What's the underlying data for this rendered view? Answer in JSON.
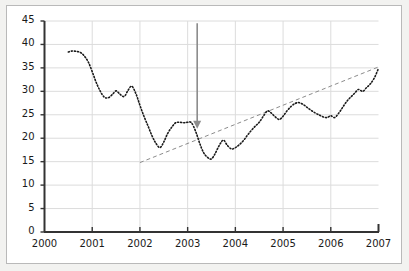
{
  "chart_data": {
    "type": "line",
    "title": "",
    "subtitle": "",
    "xlabel": "",
    "ylabel": "",
    "xlim": [
      2000,
      2007
    ],
    "ylim": [
      0,
      45
    ],
    "grid": true,
    "legend": "none",
    "x_ticks": [
      "2000",
      "2001",
      "2002",
      "2003",
      "2004",
      "2005",
      "2006",
      "2007"
    ],
    "y_ticks": [
      "0",
      "5",
      "10",
      "15",
      "20",
      "25",
      "30",
      "35",
      "40",
      "45"
    ],
    "series": [
      {
        "name": "observed",
        "style": "dotted",
        "color": "#1a1a1a",
        "x": [
          2000.5,
          2000.58,
          2000.67,
          2000.75,
          2000.83,
          2000.92,
          2001.0,
          2001.08,
          2001.17,
          2001.25,
          2001.33,
          2001.42,
          2001.5,
          2001.58,
          2001.67,
          2001.75,
          2001.83,
          2001.92,
          2002.0,
          2002.08,
          2002.17,
          2002.25,
          2002.33,
          2002.42,
          2002.5,
          2002.58,
          2002.67,
          2002.75,
          2002.83,
          2002.92,
          2003.0,
          2003.08,
          2003.17,
          2003.25,
          2003.33,
          2003.42,
          2003.5,
          2003.58,
          2003.67,
          2003.75,
          2003.83,
          2003.92,
          2004.0,
          2004.08,
          2004.17,
          2004.25,
          2004.33,
          2004.42,
          2004.5,
          2004.58,
          2004.67,
          2004.75,
          2004.83,
          2004.92,
          2005.0,
          2005.08,
          2005.17,
          2005.25,
          2005.33,
          2005.42,
          2005.5,
          2005.58,
          2005.67,
          2005.75,
          2005.83,
          2005.92,
          2006.0,
          2006.08,
          2006.17,
          2006.25,
          2006.33,
          2006.42,
          2006.5,
          2006.58,
          2006.67,
          2006.75,
          2006.83,
          2006.92,
          2007.0
        ],
        "values": [
          38.4,
          38.6,
          38.5,
          38.3,
          37.6,
          36.2,
          34.2,
          32.0,
          30.0,
          28.8,
          28.6,
          29.3,
          30.1,
          29.4,
          28.9,
          30.2,
          31.1,
          29.4,
          27.0,
          24.8,
          22.6,
          20.6,
          19.0,
          18.0,
          19.2,
          21.0,
          22.4,
          23.3,
          23.4,
          23.3,
          23.4,
          23.3,
          21.4,
          19.0,
          17.0,
          15.9,
          15.6,
          16.8,
          18.6,
          19.6,
          18.5,
          17.7,
          18.0,
          18.6,
          19.5,
          20.6,
          21.6,
          22.6,
          23.4,
          24.6,
          25.8,
          25.4,
          24.6,
          24.0,
          24.7,
          25.8,
          26.8,
          27.4,
          27.6,
          27.2,
          26.6,
          26.0,
          25.4,
          25.0,
          24.6,
          24.4,
          24.8,
          24.4,
          25.4,
          26.6,
          27.8,
          28.8,
          29.6,
          30.4,
          30.0,
          30.8,
          31.6,
          33.0,
          34.9
        ]
      },
      {
        "name": "trend",
        "style": "dashed",
        "color": "#8c8c8c",
        "x": [
          2002.0,
          2007.0
        ],
        "values": [
          14.8,
          35.2
        ]
      }
    ],
    "annotations": [
      {
        "name": "downward-arrow",
        "type": "arrow",
        "direction": "down",
        "color": "#8c8c8c",
        "x": 2003.2,
        "y_start": 44.5,
        "y_end": 22.0
      }
    ]
  }
}
